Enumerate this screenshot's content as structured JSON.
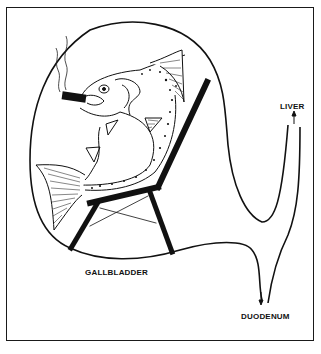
{
  "figure": {
    "type": "cartoon-anatomy-diagram",
    "colors": {
      "ink": "#111111",
      "background": "#ffffff"
    }
  },
  "labels": {
    "liver": "LIVER",
    "gallbladder": "GALLBLADDER",
    "duodenum": "DUODENUM"
  },
  "arrows": {
    "liver_arrow": "up",
    "duodenum_arrow": "down"
  },
  "icons": {
    "fish": "fish-icon",
    "cigar": "cigar-icon",
    "smoke": "smoke-icon",
    "chair": "lounge-chair-icon"
  }
}
